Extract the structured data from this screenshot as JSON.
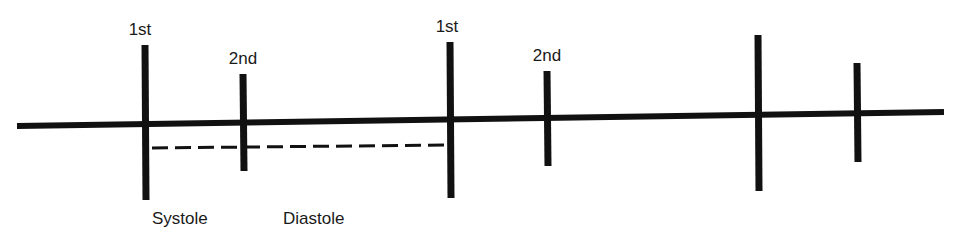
{
  "diagram": {
    "colors": {
      "line": "#111111",
      "text": "#1a1a1a",
      "background": "#ffffff"
    },
    "baseline": {
      "x1": 17,
      "y1": 126,
      "x2": 944,
      "y2": 112
    },
    "ticks": [
      {
        "id": "tick-1",
        "x": 145,
        "top": 45,
        "bottom": 200,
        "label": "1st",
        "label_x": 140,
        "label_y": 35
      },
      {
        "id": "tick-2",
        "x": 243,
        "top": 74,
        "bottom": 171,
        "label": "2nd",
        "label_x": 243,
        "label_y": 64
      },
      {
        "id": "tick-3",
        "x": 450,
        "top": 42,
        "bottom": 198,
        "label": "1st",
        "label_x": 447,
        "label_y": 32
      },
      {
        "id": "tick-4",
        "x": 547,
        "top": 71,
        "bottom": 166,
        "label": "2nd",
        "label_x": 547,
        "label_y": 61
      },
      {
        "id": "tick-5",
        "x": 758,
        "top": 35,
        "bottom": 191,
        "label": "",
        "label_x": 758,
        "label_y": 25
      },
      {
        "id": "tick-6",
        "x": 857,
        "top": 63,
        "bottom": 162,
        "label": "",
        "label_x": 857,
        "label_y": 53
      }
    ],
    "dashed_interval": {
      "x1": 152,
      "y1": 148,
      "x2": 447,
      "y2": 145
    },
    "phase_labels": [
      {
        "id": "systole",
        "text": "Systole",
        "x": 152,
        "y": 224
      },
      {
        "id": "diastole",
        "text": "Diastole",
        "x": 283,
        "y": 224
      }
    ]
  }
}
